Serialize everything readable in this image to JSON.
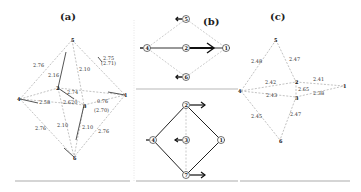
{
  "figure": {
    "panels": [
      {
        "id": "a",
        "title": "(a)",
        "atoms": [
          {
            "id": "1",
            "label": "1",
            "x": 125,
            "y": 95
          },
          {
            "id": "2",
            "label": "2",
            "x": 58,
            "y": 88
          },
          {
            "id": "3",
            "label": "3",
            "x": 84,
            "y": 105
          },
          {
            "id": "4",
            "label": "4",
            "x": 20,
            "y": 99
          },
          {
            "id": "5",
            "label": "5",
            "x": 72,
            "y": 40
          },
          {
            "id": "6",
            "label": "6",
            "x": 74,
            "y": 157
          }
        ],
        "bond_labels": [
          {
            "text": "2.76",
            "x": 33,
            "y": 67
          },
          {
            "text": "2.16",
            "x": 50,
            "y": 76
          },
          {
            "text": "2.10",
            "x": 80,
            "y": 70
          },
          {
            "text": "2.75",
            "x": 102,
            "y": 60
          },
          {
            "text": "(2.71)",
            "x": 100,
            "y": 65
          },
          {
            "text": "2.74",
            "x": 67,
            "y": 93
          },
          {
            "text": "2.58",
            "x": 38,
            "y": 104
          },
          {
            "text": "2.620",
            "x": 64,
            "y": 104
          },
          {
            "text": "0.76",
            "x": 96,
            "y": 102
          },
          {
            "text": "(2.70)",
            "x": 94,
            "y": 112
          },
          {
            "text": "2.76",
            "x": 35,
            "y": 130
          },
          {
            "text": "2.10",
            "x": 57,
            "y": 127
          },
          {
            "text": "2.10",
            "x": 82,
            "y": 129
          },
          {
            "text": "2.76",
            "x": 98,
            "y": 133
          }
        ]
      },
      {
        "id": "b",
        "title": "(b)",
        "top_diagram": {
          "atoms": [
            {
              "label": "5",
              "x": 186,
              "y": 19
            },
            {
              "label": "4",
              "x": 147,
              "y": 48
            },
            {
              "label": "2",
              "x": 186,
              "y": 48
            },
            {
              "label": "1",
              "x": 226,
              "y": 48
            },
            {
              "label": "6",
              "x": 186,
              "y": 77
            }
          ]
        },
        "bottom_diagram": {
          "atoms": [
            {
              "label": "2",
              "x": 186,
              "y": 105
            },
            {
              "label": "4",
              "x": 153,
              "y": 140
            },
            {
              "label": "3",
              "x": 186,
              "y": 140
            },
            {
              "label": "1",
              "x": 221,
              "y": 140
            },
            {
              "label": "7",
              "x": 186,
              "y": 175
            }
          ]
        }
      },
      {
        "id": "c",
        "title": "(c)",
        "atoms": [
          {
            "label": "5",
            "x": 276,
            "y": 40
          },
          {
            "label": "4",
            "x": 241,
            "y": 91
          },
          {
            "label": "2",
            "x": 296,
            "y": 82
          },
          {
            "label": "3",
            "x": 296,
            "y": 97
          },
          {
            "label": "1",
            "x": 344,
            "y": 86
          },
          {
            "label": "6",
            "x": 280,
            "y": 140
          }
        ],
        "bond_labels": [
          {
            "text": "2.48",
            "x": 252,
            "y": 63
          },
          {
            "text": "2.47",
            "x": 290,
            "y": 61
          },
          {
            "text": "2.42",
            "x": 266,
            "y": 83
          },
          {
            "text": "2.41",
            "x": 314,
            "y": 81
          },
          {
            "text": "2.65",
            "x": 298,
            "y": 90
          },
          {
            "text": "2.43",
            "x": 266,
            "y": 96
          },
          {
            "text": "2.38",
            "x": 314,
            "y": 94
          },
          {
            "text": "2.45",
            "x": 252,
            "y": 118
          },
          {
            "text": "2.47",
            "x": 290,
            "y": 116
          }
        ]
      }
    ]
  }
}
